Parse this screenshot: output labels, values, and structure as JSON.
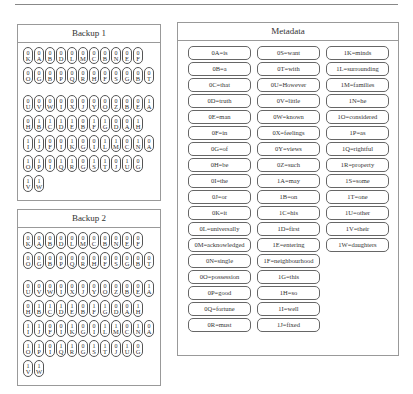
{
  "backup1": {
    "title": "Backup 1",
    "rows": [
      [
        [
          "0",
          "K"
        ],
        [
          "0",
          "A"
        ],
        [
          "0",
          "B"
        ],
        [
          "0",
          "D"
        ],
        [
          "0",
          "L"
        ],
        [
          "0",
          "M"
        ],
        [
          "0",
          "C"
        ],
        [
          "0",
          "B"
        ],
        [
          "0",
          "N"
        ],
        [
          "0",
          "E"
        ],
        [
          "0",
          "F"
        ]
      ],
      [
        [
          "0",
          "O"
        ],
        [
          "0",
          "G"
        ],
        [
          "0",
          "B"
        ],
        [
          "0",
          "P"
        ],
        [
          "0",
          "Q"
        ],
        [
          "0",
          "R"
        ],
        [
          "0",
          "H"
        ],
        [
          "0",
          "F"
        ],
        [
          "0",
          "S"
        ],
        [
          "0",
          "G"
        ],
        [
          "0",
          "B"
        ],
        [
          "0",
          "T"
        ]
      ],
      [
        [
          "0",
          "U"
        ],
        [
          "0",
          "V"
        ],
        [
          "0",
          "W"
        ],
        [
          "0",
          "I"
        ],
        [
          "0",
          "X"
        ],
        [
          "0",
          "J"
        ],
        [
          "0",
          "Y"
        ],
        [
          "0",
          "O"
        ],
        [
          "0",
          "Z"
        ],
        [
          "0",
          "B"
        ],
        [
          "0",
          "E"
        ],
        [
          "1",
          "A"
        ]
      ],
      [
        [
          "0",
          "H"
        ],
        [
          "1",
          "B"
        ],
        [
          "1",
          "C"
        ],
        [
          "1",
          "D"
        ],
        [
          "1",
          "E"
        ],
        [
          "0",
          "B"
        ],
        [
          "1",
          "F"
        ],
        [
          "1",
          "G"
        ],
        [
          "0",
          "D"
        ],
        [
          "0",
          "A"
        ],
        [
          "1",
          "H"
        ]
      ],
      [
        [
          "1",
          "I"
        ],
        [
          "1",
          "J"
        ],
        [
          "0",
          "F"
        ],
        [
          "0",
          "I"
        ],
        [
          "1",
          "K"
        ],
        [
          "0",
          "G"
        ],
        [
          "0",
          "I"
        ],
        [
          "1",
          "L"
        ],
        [
          "1",
          "M"
        ],
        [
          "0",
          "C"
        ],
        [
          "1",
          "N"
        ],
        [
          "0",
          "A"
        ]
      ],
      [
        [
          "1",
          "O"
        ],
        [
          "1",
          "P"
        ],
        [
          "0",
          "I"
        ],
        [
          "1",
          "Q"
        ],
        [
          "1",
          "R"
        ],
        [
          "0",
          "G"
        ],
        [
          "1",
          "S"
        ],
        [
          "1",
          "T"
        ],
        [
          "0",
          "J"
        ],
        [
          "1",
          "U"
        ],
        [
          "0",
          "G"
        ]
      ],
      [
        [
          "1",
          "V"
        ],
        [
          "1",
          "W"
        ]
      ]
    ]
  },
  "backup2": {
    "title": "Backup 2",
    "rows": [
      [
        [
          "0",
          "K"
        ],
        [
          "0",
          "A"
        ],
        [
          "0",
          "B"
        ],
        [
          "0",
          "D"
        ],
        [
          "0",
          "L"
        ],
        [
          "0",
          "M"
        ],
        [
          "0",
          "C"
        ],
        [
          "0",
          "B"
        ],
        [
          "0",
          "N"
        ],
        [
          "0",
          "E"
        ],
        [
          "0",
          "F"
        ]
      ],
      [
        [
          "0",
          "O"
        ],
        [
          "0",
          "G"
        ],
        [
          "0",
          "B"
        ],
        [
          "0",
          "P"
        ],
        [
          "0",
          "Q"
        ],
        [
          "0",
          "R"
        ],
        [
          "0",
          "H"
        ],
        [
          "0",
          "F"
        ],
        [
          "0",
          "S"
        ],
        [
          "0",
          "G"
        ],
        [
          "0",
          "B"
        ],
        [
          "0",
          "T"
        ]
      ],
      [
        [
          "0",
          "U"
        ],
        [
          "0",
          "V"
        ],
        [
          "0",
          "W"
        ],
        [
          "0",
          "I"
        ],
        [
          "0",
          "X"
        ],
        [
          "0",
          "J"
        ],
        [
          "0",
          "Y"
        ],
        [
          "0",
          "O"
        ],
        [
          "0",
          "Z"
        ],
        [
          "0",
          "B"
        ],
        [
          "0",
          "E"
        ],
        [
          "1",
          "A"
        ]
      ],
      [
        [
          "0",
          "H"
        ],
        [
          "1",
          "B"
        ],
        [
          "1",
          "C"
        ],
        [
          "1",
          "D"
        ],
        [
          "1",
          "E"
        ],
        [
          "0",
          "B"
        ],
        [
          "1",
          "F"
        ],
        [
          "1",
          "G"
        ],
        [
          "0",
          "D"
        ],
        [
          "0",
          "A"
        ],
        [
          "1",
          "H"
        ]
      ],
      [
        [
          "1",
          "I"
        ],
        [
          "1",
          "J"
        ],
        [
          "0",
          "F"
        ],
        [
          "0",
          "I"
        ],
        [
          "1",
          "K"
        ],
        [
          "0",
          "G"
        ],
        [
          "0",
          "I"
        ],
        [
          "1",
          "L"
        ],
        [
          "1",
          "M"
        ],
        [
          "0",
          "C"
        ],
        [
          "1",
          "N"
        ],
        [
          "0",
          "A"
        ]
      ],
      [
        [
          "1",
          "O"
        ],
        [
          "1",
          "P"
        ],
        [
          "0",
          "I"
        ],
        [
          "1",
          "Q"
        ],
        [
          "1",
          "R"
        ],
        [
          "0",
          "G"
        ],
        [
          "1",
          "S"
        ],
        [
          "1",
          "T"
        ],
        [
          "0",
          "J"
        ],
        [
          "1",
          "U"
        ],
        [
          "0",
          "G"
        ]
      ],
      [
        [
          "1",
          "V"
        ],
        [
          "1",
          "W"
        ]
      ]
    ]
  },
  "metadata": {
    "title": "Metadata",
    "columns": [
      [
        "0A=is",
        "0B=a",
        "0C=that",
        "0D=truth",
        "0E=man",
        "0F=in",
        "0G=of",
        "0H=be",
        "0I=the",
        "0J=or",
        "0K=it",
        "0L=universally",
        "0M=acknowledged",
        "0N=single",
        "0O=possession",
        "0P=good",
        "0Q=fortune",
        "0R=must"
      ],
      [
        "0S=want",
        "0T=with",
        "0U=However",
        "0V=little",
        "0W=known",
        "0X=feelings",
        "0Y=views",
        "0Z=such",
        "1A=may",
        "1B=on",
        "1C=his",
        "1D=first",
        "1E=entering",
        "1F=neighbourhood",
        "1G=this",
        "1H=so",
        "1I=well",
        "1J=fixed"
      ],
      [
        "1K=minds",
        "1L=surrounding",
        "1M=families",
        "1N=he",
        "1O=considered",
        "1P=as",
        "1Q=rightful",
        "1R=property",
        "1S=some",
        "1T=one",
        "1U=other",
        "1V=their",
        "1W=daughters"
      ]
    ]
  }
}
